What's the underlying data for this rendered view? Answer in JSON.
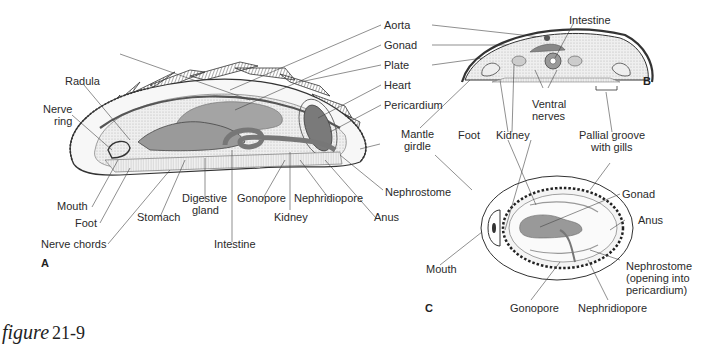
{
  "figure": {
    "caption_word": "figure",
    "caption_number": "21-9"
  },
  "panels": {
    "A": "A",
    "B": "B",
    "C": "C"
  },
  "panel_a": {
    "labels": {
      "aorta": "Aorta",
      "gonad": "Gonad",
      "plate": "Plate",
      "heart": "Heart",
      "pericardium": "Pericardium",
      "radula": "Radula",
      "nerve_ring_1": "Nerve",
      "nerve_ring_2": "ring",
      "mouth": "Mouth",
      "foot": "Foot",
      "nerve_chords": "Nerve chords",
      "stomach": "Stomach",
      "digestive_gland_1": "Digestive",
      "digestive_gland_2": "gland",
      "intestine": "Intestine",
      "gonopore": "Gonopore",
      "kidney": "Kidney",
      "nephridiopore": "Nephridiopore",
      "anus": "Anus",
      "nephrostome": "Nephrostome"
    }
  },
  "shared": {
    "mantle_girdle_1": "Mantle",
    "mantle_girdle_2": "girdle"
  },
  "panel_b": {
    "labels": {
      "intestine": "Intestine",
      "ventral_nerves_1": "Ventral",
      "ventral_nerves_2": "nerves",
      "foot": "Foot",
      "kidney": "Kidney",
      "pallial_groove_1": "Pallial groove",
      "pallial_groove_2": "with gills"
    }
  },
  "panel_c": {
    "labels": {
      "gonad": "Gonad",
      "anus": "Anus",
      "mouth": "Mouth",
      "nephrostome_1": "Nephrostome",
      "nephrostome_2": "(opening into",
      "nephrostome_3": "pericardium)",
      "gonopore": "Gonopore",
      "nephridiopore": "Nephridiopore"
    }
  },
  "colors": {
    "ink": "#2a2a2a",
    "organ_gray": "#9a9a9a",
    "heart_dark": "#6e6e6e",
    "stipple": "#e4e4e4",
    "background": "#ffffff"
  }
}
